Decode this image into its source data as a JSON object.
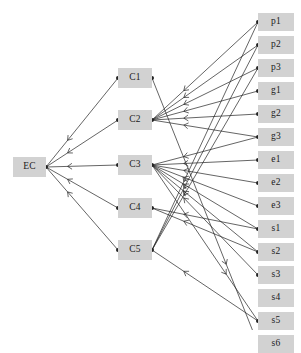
{
  "diagram": {
    "canvas": {
      "width": 301,
      "height": 330,
      "background": "#ffffff"
    },
    "style": {
      "node_fill": "#d2d2d2",
      "node_text": "#1a1a1a",
      "edge_color": "#222222",
      "edge_width": 0.7,
      "dot_radius": 2.0,
      "arrow_size": 3.4
    },
    "columns": {
      "source": {
        "label": "EC",
        "x": 13,
        "y": 157,
        "w": 33,
        "h": 20
      },
      "middle": {
        "x": 118,
        "y_start": 68,
        "spacing": 43,
        "w": 34,
        "h": 20
      },
      "right": {
        "x": 258,
        "y_start": 13,
        "spacing": 23.6,
        "w": 36,
        "h": 18
      }
    },
    "nodes": {
      "source": [
        {
          "id": "EC",
          "label": "EC",
          "x": 13,
          "y": 157,
          "w": 33,
          "h": 20
        }
      ],
      "middle": [
        {
          "id": "C1",
          "label": "C1",
          "x": 118,
          "y": 68,
          "w": 34,
          "h": 20
        },
        {
          "id": "C2",
          "label": "C2",
          "x": 118,
          "y": 110,
          "w": 34,
          "h": 20
        },
        {
          "id": "C3",
          "label": "C3",
          "x": 118,
          "y": 155,
          "w": 34,
          "h": 20
        },
        {
          "id": "C4",
          "label": "C4",
          "x": 118,
          "y": 198,
          "w": 34,
          "h": 20
        },
        {
          "id": "C5",
          "label": "C5",
          "x": 118,
          "y": 240,
          "w": 34,
          "h": 20
        }
      ],
      "right": [
        {
          "id": "p1",
          "label": "p1",
          "x": 258,
          "y": 13,
          "w": 36,
          "h": 18
        },
        {
          "id": "p2",
          "label": "p2",
          "x": 258,
          "y": 36,
          "w": 36,
          "h": 18
        },
        {
          "id": "p3",
          "label": "p3",
          "x": 258,
          "y": 59,
          "w": 36,
          "h": 18
        },
        {
          "id": "g1",
          "label": "g1",
          "x": 258,
          "y": 82,
          "w": 36,
          "h": 18
        },
        {
          "id": "g2",
          "label": "g2",
          "x": 258,
          "y": 105,
          "w": 36,
          "h": 18
        },
        {
          "id": "g3",
          "label": "g3",
          "x": 258,
          "y": 128,
          "w": 36,
          "h": 18
        },
        {
          "id": "e1",
          "label": "e1",
          "x": 258,
          "y": 151,
          "w": 36,
          "h": 18
        },
        {
          "id": "e2",
          "label": "e2",
          "x": 258,
          "y": 174,
          "w": 36,
          "h": 18
        },
        {
          "id": "e3",
          "label": "e3",
          "x": 258,
          "y": 197,
          "w": 36,
          "h": 18
        },
        {
          "id": "s1",
          "label": "s1",
          "x": 258,
          "y": 220,
          "w": 36,
          "h": 18
        },
        {
          "id": "s2",
          "label": "s2",
          "x": 258,
          "y": 243,
          "w": 36,
          "h": 18
        },
        {
          "id": "s3",
          "label": "s3",
          "x": 258,
          "y": 266,
          "w": 36,
          "h": 18
        },
        {
          "id": "s4",
          "label": "s4",
          "x": 258,
          "y": 289,
          "w": 36,
          "h": 18
        },
        {
          "id": "s5",
          "label": "s5",
          "x": 258,
          "y": 312,
          "w": 36,
          "h": 18
        },
        {
          "id": "s6",
          "label": "s6",
          "x": 258,
          "y": 335,
          "w": 36,
          "h": 18
        }
      ]
    },
    "edges": [
      {
        "from": "C1",
        "to": "EC"
      },
      {
        "from": "C2",
        "to": "EC"
      },
      {
        "from": "C3",
        "to": "EC"
      },
      {
        "from": "C4",
        "to": "EC"
      },
      {
        "from": "C5",
        "to": "EC"
      },
      {
        "from": "p1",
        "to": "C2"
      },
      {
        "from": "p2",
        "to": "C2"
      },
      {
        "from": "p3",
        "to": "C2"
      },
      {
        "from": "g1",
        "to": "C2"
      },
      {
        "from": "g2",
        "to": "C2"
      },
      {
        "from": "g3",
        "to": "C2"
      },
      {
        "from": "e1",
        "to": "C3"
      },
      {
        "from": "e2",
        "to": "C3"
      },
      {
        "from": "e3",
        "to": "C3"
      },
      {
        "from": "g3",
        "to": "C3"
      },
      {
        "from": "s1",
        "to": "C3"
      },
      {
        "from": "s2",
        "to": "C3"
      },
      {
        "from": "s3",
        "to": "C3"
      },
      {
        "from": "s1",
        "to": "C4"
      },
      {
        "from": "s2",
        "to": "C4"
      },
      {
        "from": "p1",
        "to": "C5"
      },
      {
        "from": "p2",
        "to": "C5"
      },
      {
        "from": "p3",
        "to": "C5"
      },
      {
        "from": "s5",
        "to": "C5"
      },
      {
        "from": "C1",
        "to": "s6"
      },
      {
        "from": "C3",
        "to": "s5"
      }
    ]
  }
}
